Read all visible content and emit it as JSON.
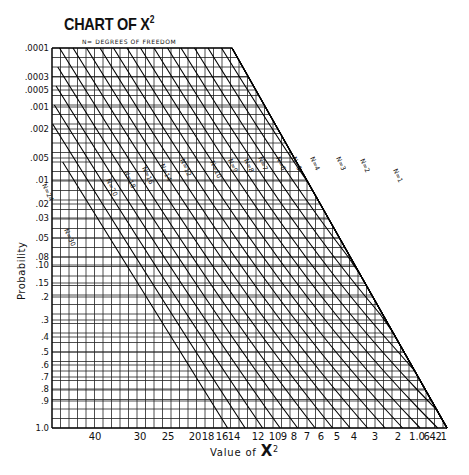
{
  "header": {
    "title": "CHART OF X",
    "title_sup": "2",
    "subtitle": "N= DEGREES OF FREEDOM"
  },
  "axes": {
    "ylabel": "Probability",
    "xlabel": "Value of ",
    "xlabel_symbol": "X",
    "xlabel_sup": "2"
  },
  "chart_data": {
    "type": "line",
    "subtitle": "N = Degrees of Freedom",
    "xlabel": "Value of χ²",
    "ylabel": "Probability",
    "y_ticks": [
      ".0001",
      ".0003",
      ".0005",
      ".001",
      ".002",
      ".005",
      ".01",
      ".02",
      ".03",
      ".05",
      ".08",
      ".10",
      ".15",
      ".2",
      ".3",
      ".4",
      ".5",
      ".6",
      ".7",
      ".8",
      ".9",
      "1.0"
    ],
    "x_ticks": [
      "40",
      "30",
      "25",
      "20",
      "18",
      "16",
      "14",
      "12",
      "10",
      "9",
      "8",
      "7",
      "6",
      "5",
      "4",
      "3",
      "2",
      "1.0",
      ".6",
      ".4",
      ".2",
      ".1"
    ],
    "series_labels": [
      "N=30",
      "N=24",
      "N=20",
      "N=18",
      "N=16",
      "N=14",
      "N=12",
      "N=10",
      "N=9",
      "N=8",
      "N=7",
      "N=6",
      "N=5",
      "N=4",
      "N=3",
      "N=2",
      "N=1"
    ],
    "grid": true,
    "legend_position": "inline labels on curves",
    "ylim": [
      0.0001,
      1.0
    ],
    "x_direction": "decreasing left to right"
  }
}
